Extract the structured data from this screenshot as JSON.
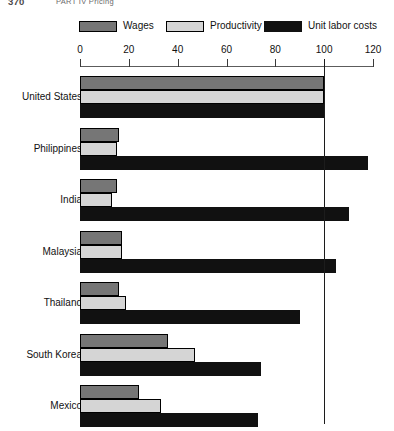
{
  "page": {
    "folio": "370",
    "running_head": "PART IV  Pricing"
  },
  "legend": {
    "items": [
      {
        "label": "Wages",
        "color": "#767676",
        "key": "wages"
      },
      {
        "label": "Productivity",
        "color": "#d5d5d5",
        "key": "productivity"
      },
      {
        "label": "Unit labor costs",
        "color": "#111111",
        "key": "unit_labor_costs"
      }
    ]
  },
  "axis": {
    "ticks": [
      {
        "label": "0",
        "value": 0
      },
      {
        "label": "20",
        "value": 20
      },
      {
        "label": "40",
        "value": 40
      },
      {
        "label": "60",
        "value": 60
      },
      {
        "label": "80",
        "value": 80
      },
      {
        "label": "100",
        "value": 100
      },
      {
        "label": "120",
        "value": 120
      }
    ],
    "reference_line_value": 100
  },
  "chart_data": {
    "type": "bar",
    "orientation": "horizontal",
    "title": "",
    "subtitle": "",
    "xlabel": "",
    "ylabel": "",
    "xlim": [
      0,
      120
    ],
    "grid": false,
    "legend_position": "top",
    "annotations": [
      {
        "type": "reference-line",
        "axis": "x",
        "value": 100
      }
    ],
    "categories": [
      "United States",
      "Philippines",
      "India",
      "Malaysia",
      "Thailand",
      "South Korea",
      "Mexico"
    ],
    "series": [
      {
        "name": "Wages",
        "color": "#767676",
        "values": [
          100,
          16,
          15,
          17,
          16,
          36,
          24
        ]
      },
      {
        "name": "Productivity",
        "color": "#d5d5d5",
        "values": [
          100,
          15,
          13,
          17,
          19,
          47,
          33
        ]
      },
      {
        "name": "Unit labor costs",
        "color": "#111111",
        "values": [
          100,
          118,
          110,
          105,
          90,
          74,
          73
        ]
      }
    ]
  }
}
